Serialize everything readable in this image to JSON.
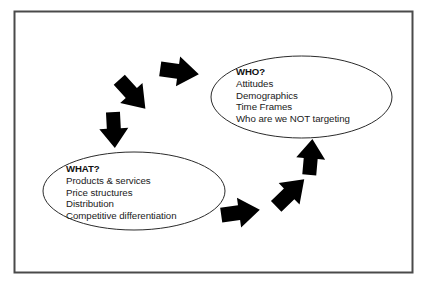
{
  "frame": {
    "border_color": "#4a4a4a",
    "background_color": "#ffffff"
  },
  "colors": {
    "arrow_fill": "#000000",
    "ellipse_stroke": "#2b2b2b",
    "text": "#1a1a1a"
  },
  "bubbles": [
    {
      "id": "who",
      "heading": "WHO?",
      "lines": [
        "Attitudes",
        "Demographics",
        "Time Frames",
        "Who are we NOT targeting"
      ]
    },
    {
      "id": "what",
      "heading": "WHAT?",
      "lines": [
        "Products & services",
        "Price structures",
        "Distribution",
        "Competitive differentiation"
      ]
    }
  ],
  "arrows": [
    {
      "id": "who-to-what-1",
      "direction": "left"
    },
    {
      "id": "who-to-what-2",
      "direction": "down-left"
    },
    {
      "id": "who-to-what-3",
      "direction": "down"
    },
    {
      "id": "what-to-who-1",
      "direction": "right"
    },
    {
      "id": "what-to-who-2",
      "direction": "up-right"
    },
    {
      "id": "what-to-who-3",
      "direction": "up"
    }
  ]
}
